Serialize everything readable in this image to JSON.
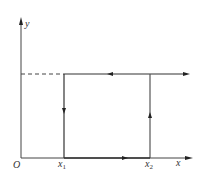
{
  "diagram": {
    "axes": {
      "x_label": "x",
      "y_label": "y",
      "origin_label": "O"
    },
    "ticks": [
      {
        "base": "x",
        "sub": "1"
      },
      {
        "base": "x",
        "sub": "2"
      }
    ],
    "colors": {
      "line": "#333333",
      "dashed": "#444444"
    }
  }
}
